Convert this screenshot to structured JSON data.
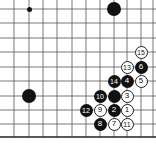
{
  "board": {
    "xs": [
      14,
      29,
      43,
      57,
      72,
      86,
      100,
      114,
      127,
      141,
      153
    ],
    "ys": [
      9,
      23,
      38,
      52,
      67,
      81,
      96,
      110,
      124
    ],
    "bottom_edge_y": 137,
    "line_color": "#555555",
    "edge_color": "#222222"
  },
  "markers": [
    {
      "type": "small-dot",
      "col": 1,
      "row": 0
    }
  ],
  "stones": [
    {
      "color": "black",
      "col": 7,
      "row": 0,
      "label": ""
    },
    {
      "color": "black",
      "col": 1,
      "row": 6,
      "label": ""
    },
    {
      "color": "white",
      "col": 9,
      "row": 3,
      "label": "15"
    },
    {
      "color": "white",
      "col": 8,
      "row": 4,
      "label": "13"
    },
    {
      "color": "black",
      "col": 9,
      "row": 4,
      "label": "6"
    },
    {
      "color": "black",
      "col": 7,
      "row": 5,
      "label": "14"
    },
    {
      "color": "black",
      "col": 8,
      "row": 5,
      "label": "4"
    },
    {
      "color": "white",
      "col": 9,
      "row": 5,
      "label": "5"
    },
    {
      "color": "black",
      "col": 6,
      "row": 6,
      "label": "10"
    },
    {
      "color": "black",
      "col": 7,
      "row": 6,
      "label": ""
    },
    {
      "color": "white",
      "col": 8,
      "row": 6,
      "label": "3"
    },
    {
      "color": "black",
      "col": 5,
      "row": 7,
      "label": "12"
    },
    {
      "color": "white",
      "col": 6,
      "row": 7,
      "label": "9"
    },
    {
      "color": "black",
      "col": 7,
      "row": 7,
      "label": "2"
    },
    {
      "color": "white",
      "col": 8,
      "row": 7,
      "label": "1"
    },
    {
      "color": "black",
      "col": 6,
      "row": 8,
      "label": "8"
    },
    {
      "color": "white",
      "col": 7,
      "row": 8,
      "label": "7"
    },
    {
      "color": "white",
      "col": 8,
      "row": 8,
      "label": "11"
    }
  ]
}
